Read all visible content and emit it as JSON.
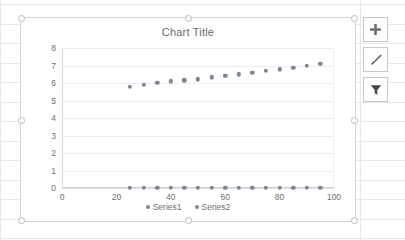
{
  "app": {
    "context": "excel-worksheet-with-embedded-chart"
  },
  "chart": {
    "title": "Chart Title",
    "legend": [
      {
        "label": "Series1",
        "color": "#7b8794"
      },
      {
        "label": "Series2",
        "color": "#7b8794"
      }
    ],
    "selected": true
  },
  "chart_buttons": [
    {
      "name": "chart-elements-button",
      "icon": "plus-icon",
      "tooltip": "Chart Elements"
    },
    {
      "name": "chart-styles-button",
      "icon": "brush-icon",
      "tooltip": "Chart Styles"
    },
    {
      "name": "chart-filters-button",
      "icon": "funnel-icon",
      "tooltip": "Chart Filters"
    }
  ],
  "chart_data": {
    "type": "scatter",
    "title": "Chart Title",
    "xlabel": "",
    "ylabel": "",
    "xlim": [
      0,
      100
    ],
    "ylim": [
      0,
      8
    ],
    "xticks": [
      0,
      20,
      40,
      60,
      80,
      100
    ],
    "yticks": [
      0,
      1,
      2,
      3,
      4,
      5,
      6,
      7,
      8
    ],
    "grid": "horizontal",
    "legend_position": "bottom",
    "marker_color": "#7b8794",
    "series": [
      {
        "name": "Series1",
        "color": "#7b8794",
        "x": [
          25,
          30,
          35,
          40,
          45,
          50,
          55,
          60,
          65,
          70,
          75,
          80,
          85,
          90,
          95
        ],
        "y": [
          5.8,
          5.9,
          6.0,
          6.1,
          6.15,
          6.22,
          6.32,
          6.4,
          6.5,
          6.6,
          6.7,
          6.78,
          6.88,
          6.98,
          7.08
        ]
      },
      {
        "name": "Series2",
        "color": "#7b8794",
        "x": [
          25,
          30,
          35,
          40,
          45,
          50,
          55,
          60,
          65,
          70,
          75,
          80,
          85,
          90,
          95
        ],
        "y": [
          0,
          0,
          0,
          0,
          0,
          0,
          0,
          0,
          0,
          0,
          0,
          0,
          0,
          0,
          0
        ]
      }
    ]
  }
}
